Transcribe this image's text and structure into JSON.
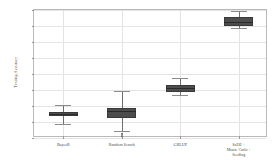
{
  "chart_data": {
    "type": "box",
    "title": "",
    "xlabel": "",
    "ylabel": "Testing Accuracy",
    "ylim": [
      0.0,
      0.4
    ],
    "grid": true,
    "legend": null,
    "ytick_labels": [
      "0.00",
      "0.05",
      "0.10",
      "0.15",
      "0.20",
      "0.25",
      "0.30",
      "0.35",
      "0.40"
    ],
    "ytick_values": [
      0.0,
      0.05,
      0.1,
      0.15,
      0.2,
      0.25,
      0.3,
      0.35,
      0.4
    ],
    "categories": [
      "BayesR",
      "Random Search",
      "GBLUP",
      "SaDE +\nMonte Carlo +\nSeeding"
    ],
    "category_labels": [
      {
        "lines": [
          "BayesR"
        ]
      },
      {
        "lines": [
          "Random Search"
        ]
      },
      {
        "lines": [
          "GBLUP"
        ]
      },
      {
        "lines": [
          "SaDE +",
          "Monte Carlo +",
          "Seeding"
        ]
      }
    ],
    "boxes": [
      {
        "name": "BayesR",
        "whisker_low": 0.045,
        "q1": 0.068,
        "median": 0.075,
        "q3": 0.082,
        "whisker_high": 0.102,
        "outliers": []
      },
      {
        "name": "Random Search",
        "whisker_low": 0.022,
        "q1": 0.062,
        "median": 0.085,
        "q3": 0.095,
        "whisker_high": 0.148,
        "outliers": [
          0.014,
          0.011,
          0.008,
          0.005,
          0.002
        ]
      },
      {
        "name": "GBLUP",
        "whisker_low": 0.135,
        "q1": 0.145,
        "median": 0.157,
        "q3": 0.165,
        "whisker_high": 0.187,
        "outliers": []
      },
      {
        "name": "SaDE + Monte Carlo + Seeding",
        "whisker_low": 0.343,
        "q1": 0.35,
        "median": 0.362,
        "q3": 0.378,
        "whisker_high": 0.398,
        "outliers": []
      }
    ],
    "colors": {
      "box_fill": "#4d4d4d",
      "box_edge": "#3a3a3a",
      "median": "#2b2b2b",
      "whisker": "#8c8c8c",
      "grid": "#e4e4e4",
      "frame": "#b9b9b9",
      "text": "#4a4a4a",
      "background": "#ffffff"
    }
  }
}
